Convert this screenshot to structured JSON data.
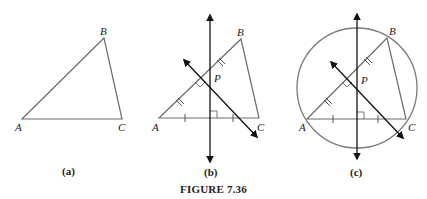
{
  "figure": {
    "title": "FIGURE 7.36",
    "panels": [
      {
        "id": "a",
        "caption": "(a)",
        "vertices": {
          "A": "A",
          "B": "B",
          "C": "C"
        },
        "description": "Triangle ABC"
      },
      {
        "id": "b",
        "caption": "(b)",
        "vertices": {
          "A": "A",
          "B": "B",
          "C": "C"
        },
        "point_label": "P",
        "description": "Perpendicular bisectors of AB and AC meeting at P"
      },
      {
        "id": "c",
        "caption": "(c)",
        "vertices": {
          "A": "A",
          "B": "B",
          "C": "C"
        },
        "point_label": "P",
        "description": "Circumscribed circle centered at P through A, B, C"
      }
    ]
  },
  "colors": {
    "triangle": "#6b6b6b",
    "bisector": "#111111",
    "circle": "#7a7a7a",
    "text": "#222222"
  }
}
